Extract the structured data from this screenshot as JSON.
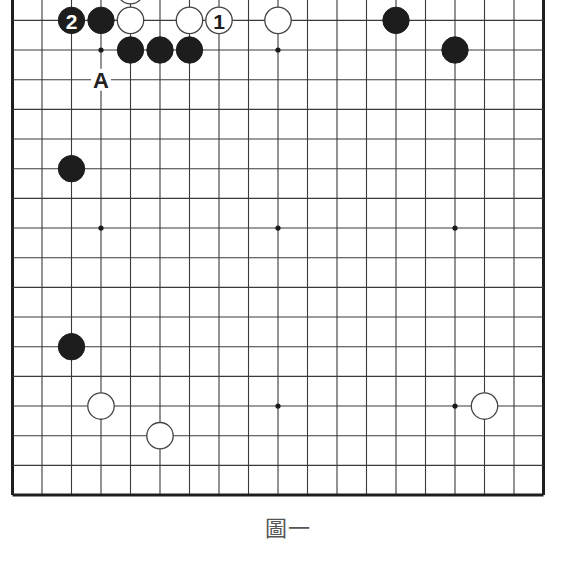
{
  "figure": {
    "caption": "圖一",
    "board_size": 19,
    "visible_rows": "2-19 (top edge cropped)",
    "colors": {
      "black_stone": "#1d1d1d",
      "white_stone": "#ffffff",
      "grid": "#3a3a3a",
      "background": "#ffffff"
    },
    "layout": {
      "origin_x": 12.5,
      "origin_y": -39,
      "spacing_x": 29.5,
      "spacing_y": 29.67,
      "stone_radius": 13.2
    },
    "star_points": [
      {
        "col": 4,
        "row": 4
      },
      {
        "col": 10,
        "row": 4
      },
      {
        "col": 16,
        "row": 4
      },
      {
        "col": 4,
        "row": 10
      },
      {
        "col": 10,
        "row": 10
      },
      {
        "col": 16,
        "row": 10
      },
      {
        "col": 4,
        "row": 16
      },
      {
        "col": 10,
        "row": 16
      },
      {
        "col": 16,
        "row": 16
      }
    ],
    "stones": [
      {
        "color": "white",
        "col": 5,
        "row": 2,
        "label": ""
      },
      {
        "color": "black",
        "col": 3,
        "row": 3,
        "label": "2"
      },
      {
        "color": "black",
        "col": 4,
        "row": 3,
        "label": ""
      },
      {
        "color": "white",
        "col": 5,
        "row": 3,
        "label": ""
      },
      {
        "color": "white",
        "col": 7,
        "row": 3,
        "label": ""
      },
      {
        "color": "white",
        "col": 8,
        "row": 3,
        "label": "1"
      },
      {
        "color": "white",
        "col": 10,
        "row": 3,
        "label": ""
      },
      {
        "color": "black",
        "col": 14,
        "row": 3,
        "label": ""
      },
      {
        "color": "black",
        "col": 5,
        "row": 4,
        "label": ""
      },
      {
        "color": "black",
        "col": 6,
        "row": 4,
        "label": ""
      },
      {
        "color": "black",
        "col": 7,
        "row": 4,
        "label": ""
      },
      {
        "color": "black",
        "col": 16,
        "row": 4,
        "label": ""
      },
      {
        "color": "black",
        "col": 3,
        "row": 8,
        "label": ""
      },
      {
        "color": "black",
        "col": 3,
        "row": 14,
        "label": ""
      },
      {
        "color": "white",
        "col": 4,
        "row": 16,
        "label": ""
      },
      {
        "color": "white",
        "col": 17,
        "row": 16,
        "label": ""
      },
      {
        "color": "white",
        "col": 6,
        "row": 17,
        "label": ""
      }
    ],
    "point_labels": [
      {
        "text": "A",
        "col": 4,
        "row": 5
      }
    ]
  }
}
